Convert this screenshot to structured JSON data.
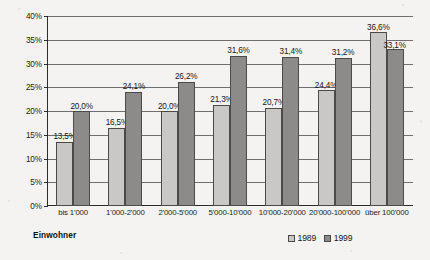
{
  "chart_data": {
    "type": "bar",
    "title": "",
    "xlabel": "Einwohner",
    "ylabel": "",
    "ylim": [
      0,
      40
    ],
    "ytick_step": 5,
    "grid": true,
    "legend_position": "bottom-right",
    "value_suffix": "%",
    "decimal_separator": ",",
    "categories": [
      "bis 1'000",
      "1'000-2'000",
      "2'000-5'000",
      "5'000-10'000",
      "10'000-20'000",
      "20'000-100'000",
      "über 100'000"
    ],
    "yticks": [
      "0%",
      "5%",
      "10%",
      "15%",
      "20%",
      "25%",
      "30%",
      "35%",
      "40%"
    ],
    "series": [
      {
        "name": "1989",
        "color": "#c9c8c6",
        "values": [
          13.5,
          16.5,
          20.0,
          21.3,
          20.7,
          24.4,
          36.6
        ],
        "labels": [
          "13,5%",
          "16,5%",
          "20,0%",
          "21,3%",
          "20,7%",
          "24,4%",
          "36,6%"
        ]
      },
      {
        "name": "1999",
        "color": "#8c8b89",
        "values": [
          20.0,
          24.1,
          26.2,
          31.6,
          31.4,
          31.2,
          33.1
        ],
        "labels": [
          "20,0%",
          "24,1%",
          "26,2%",
          "31,6%",
          "31,4%",
          "31,2%",
          "33,1%"
        ]
      }
    ]
  },
  "legend": {
    "items": [
      {
        "label": "1989",
        "swatch": "light-gray"
      },
      {
        "label": "1999",
        "swatch": "dark-gray"
      }
    ]
  }
}
